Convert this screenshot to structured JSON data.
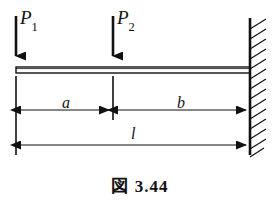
{
  "figure": {
    "caption_symbol": "図",
    "caption_number": "3.44",
    "caption_full": "図 3.44",
    "type": "cantilever-beam-diagram"
  },
  "loads": [
    {
      "id": "P1",
      "label_base": "P",
      "label_sub": "1",
      "arrow_x": 16,
      "arrow_top_y": 16,
      "arrow_tip_y": 66,
      "direction": "down"
    },
    {
      "id": "P2",
      "label_base": "P",
      "label_sub": "2",
      "arrow_x": 113,
      "arrow_top_y": 16,
      "arrow_tip_y": 66,
      "direction": "down"
    }
  ],
  "beam": {
    "left_x": 16,
    "right_x": 250,
    "top_y": 67,
    "bottom_y": 73
  },
  "support": {
    "kind": "fixed-wall",
    "wall_x": 250,
    "wall_top_y": 18,
    "wall_bottom_y": 155,
    "hatch_count": 13,
    "hatch_length": 16
  },
  "dimensions": [
    {
      "id": "a",
      "label": "a",
      "from_x": 16,
      "to_x": 113,
      "y": 110,
      "arrows": "both"
    },
    {
      "id": "b",
      "label": "b",
      "from_x": 113,
      "to_x": 250,
      "y": 110,
      "arrows": "both"
    },
    {
      "id": "l",
      "label": "l",
      "from_x": 16,
      "to_x": 250,
      "y": 145,
      "arrows": "both"
    }
  ],
  "extension_lines": [
    {
      "x": 16,
      "top_y": 76,
      "bottom_y": 155
    },
    {
      "x": 113,
      "top_y": 76,
      "bottom_y": 120
    }
  ],
  "colors": {
    "ink": "#111111",
    "background": "#ffffff"
  }
}
